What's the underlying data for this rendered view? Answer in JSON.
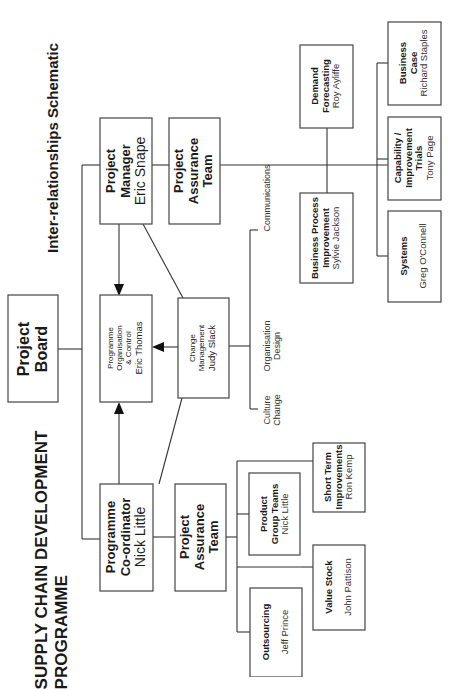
{
  "title": {
    "line1": "SUPPLY CHAIN DEVELOPMENT",
    "line2": "PROGRAMME"
  },
  "subtitle": "Inter-relationships Schematic",
  "nodes": {
    "project_board": {
      "line1": "Project",
      "line2": "Board"
    },
    "project_manager": {
      "line1": "Project",
      "line2": "Manager",
      "person": "Eric Snape"
    },
    "project_assurance_top": {
      "line1": "Project",
      "line2": "Assurance",
      "line3": "Team"
    },
    "programme_org_control": {
      "line1": "Programme",
      "line2": "Organisation",
      "line3": "& Control",
      "person": "Eric Thomas"
    },
    "change_management": {
      "line1": "Change",
      "line2": "Management",
      "person": "Judy Slack"
    },
    "programme_coordinator": {
      "line1": "Programme",
      "line2": "Co-ordinator",
      "person": "Nick Little"
    },
    "project_assurance_bottom": {
      "line1": "Project",
      "line2": "Assurance",
      "line3": "Team"
    },
    "product_group_teams": {
      "line1": "Product",
      "line2": "Group Teams",
      "person": "Nick Little"
    },
    "outsourcing": {
      "line1": "Outsourcing",
      "person": "Jeff Prince"
    },
    "short_term_improvements": {
      "line1": "Short Term",
      "line2": "Improvements",
      "person": "Ron Kemp"
    },
    "value_stock": {
      "line1": "Value Stock",
      "person": "John Pattison"
    },
    "business_process_improvement": {
      "line1": "Business Process",
      "line2": "Improvement",
      "person": "Sylvie Jackson"
    },
    "demand_forecasting": {
      "line1": "Demand",
      "line2": "Forecasting",
      "person": "Roy Ayliffe"
    },
    "systems": {
      "line1": "Systems",
      "person": "Greg O'Connell"
    },
    "capability_improvement_trials": {
      "line1": "Capability /",
      "line2": "Improvement",
      "line3": "Trials",
      "person": "Tony Page"
    },
    "business_case": {
      "line1": "Business",
      "line2": "Case",
      "person": "Richard Staples"
    }
  },
  "change_areas": {
    "communications": {
      "line1": "Communications"
    },
    "organisation_design": {
      "line1": "Organisation",
      "line2": "Design"
    },
    "culture_change": {
      "line1": "Culture",
      "line2": "Change"
    }
  }
}
